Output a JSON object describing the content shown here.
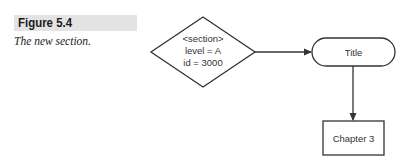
{
  "figure": {
    "label": "Figure 5.4",
    "caption": "The new section."
  },
  "diagram": {
    "nodes": [
      {
        "id": "section",
        "shape": "diamond",
        "lines": [
          "<section>",
          "level = A",
          "id = 3000"
        ]
      },
      {
        "id": "title",
        "shape": "terminal",
        "lines": [
          "Title"
        ]
      },
      {
        "id": "chapter3",
        "shape": "rectangle",
        "lines": [
          "Chapter 3"
        ]
      }
    ],
    "edges": [
      {
        "from": "section",
        "to": "title"
      },
      {
        "from": "title",
        "to": "chapter3"
      }
    ]
  },
  "colors": {
    "stroke": "#333333",
    "label_bg": "#e3e3e3"
  }
}
